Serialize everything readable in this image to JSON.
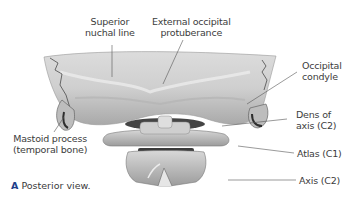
{
  "figure": {
    "view": "Posterior view",
    "caption_letter": "A",
    "caption_text": "Posterior view.",
    "colors": {
      "bone_light": "#e4e4e4",
      "bone_mid": "#c9c9c9",
      "bone_dark": "#8a8a8a",
      "shadow": "#3c3c3c",
      "leader_line": "#555555",
      "label_text": "#3c3c3c",
      "caption_letter": "#1f3f8a"
    }
  },
  "labels": {
    "superior_nuchal_line": [
      "Superior",
      "nuchal line"
    ],
    "external_occipital_protuberance": [
      "External occipital",
      "protuberance"
    ],
    "occipital_condyle": [
      "Occipital",
      "condyle"
    ],
    "dens_of_axis": [
      "Dens of",
      "axis (C2)"
    ],
    "mastoid_process": [
      "Mastoid process",
      "(temporal bone)"
    ],
    "atlas": "Atlas (C1)",
    "axis": "Axis (C2)"
  }
}
